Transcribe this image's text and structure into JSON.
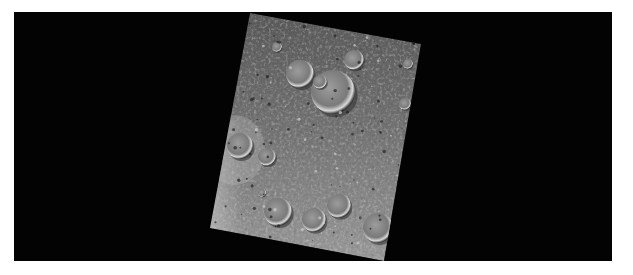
{
  "image": {
    "subject": "cratered planetary surface strip",
    "background_color": "#030303",
    "page_color": "#ffffff",
    "strip_corners": [
      [
        250,
        13
      ],
      [
        421,
        44
      ],
      [
        384,
        261
      ],
      [
        210,
        228
      ]
    ],
    "craters": [
      {
        "x": 300,
        "y": 74,
        "r": 14
      },
      {
        "x": 333,
        "y": 92,
        "r": 22
      },
      {
        "x": 354,
        "y": 60,
        "r": 10
      },
      {
        "x": 320,
        "y": 82,
        "r": 7
      },
      {
        "x": 240,
        "y": 146,
        "r": 13
      },
      {
        "x": 267,
        "y": 157,
        "r": 9
      },
      {
        "x": 278,
        "y": 212,
        "r": 14
      },
      {
        "x": 314,
        "y": 220,
        "r": 12
      },
      {
        "x": 339,
        "y": 206,
        "r": 12
      },
      {
        "x": 378,
        "y": 228,
        "r": 15
      },
      {
        "x": 277,
        "y": 47,
        "r": 5
      },
      {
        "x": 408,
        "y": 64,
        "r": 5
      },
      {
        "x": 405,
        "y": 104,
        "r": 6
      },
      {
        "x": 262,
        "y": 193,
        "r": 4
      }
    ]
  }
}
